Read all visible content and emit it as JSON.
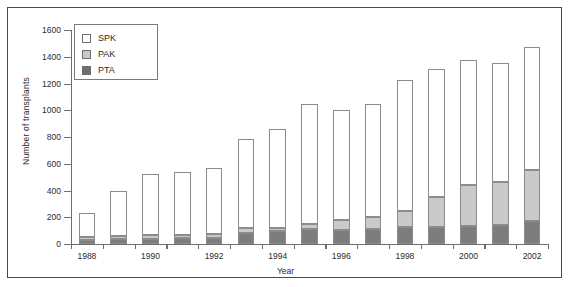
{
  "chart_data": {
    "type": "bar",
    "title": "",
    "xlabel": "Year",
    "ylabel": "Number of transplants",
    "ylim": [
      0,
      1600
    ],
    "ytick_step": 200,
    "yticks": [
      0,
      200,
      400,
      600,
      800,
      1000,
      1200,
      1400,
      1600
    ],
    "xticks_labeled": [
      "1988",
      "1990",
      "1992",
      "1994",
      "1996",
      "1998",
      "2000",
      "2002"
    ],
    "grid": false,
    "legend_position": "top-left",
    "stacked": true,
    "categories": [
      "1988",
      "1989",
      "1990",
      "1991",
      "1992",
      "1993",
      "1994",
      "1995",
      "1996",
      "1997",
      "1998",
      "1999",
      "2000",
      "2001",
      "2002"
    ],
    "series": [
      {
        "name": "PTA",
        "color": "#7d7d7d",
        "values": [
          30,
          35,
          40,
          42,
          45,
          85,
          95,
          110,
          105,
          115,
          125,
          130,
          135,
          140,
          175
        ]
      },
      {
        "name": "PAK",
        "color": "#c9c9c9",
        "values": [
          25,
          25,
          25,
          28,
          30,
          35,
          25,
          40,
          75,
          90,
          125,
          220,
          305,
          320,
          375
        ]
      },
      {
        "name": "SPK",
        "color": "#ffffff",
        "values": [
          180,
          340,
          455,
          465,
          495,
          665,
          740,
          900,
          820,
          845,
          980,
          960,
          935,
          890,
          920
        ]
      }
    ],
    "totals": [
      235,
      400,
      520,
      535,
      570,
      785,
      860,
      1050,
      1000,
      1050,
      1230,
      1310,
      1375,
      1350,
      1470
    ],
    "legend": [
      {
        "key": "SPK",
        "label": "SPK",
        "color": "#ffffff"
      },
      {
        "key": "PAK",
        "label": "PAK",
        "color": "#c9c9c9"
      },
      {
        "key": "PTA",
        "label": "PTA",
        "color": "#6f6f6f"
      }
    ]
  }
}
